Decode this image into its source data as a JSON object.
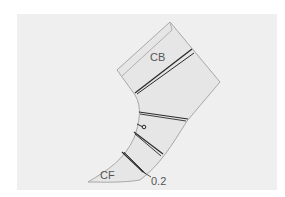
{
  "diagram": {
    "type": "sewing-pattern-piece",
    "labels": {
      "center_back": "CB",
      "center_front": "CF",
      "measurement": "0.2"
    },
    "colors": {
      "background": "#ffffff",
      "panel": "#efefef",
      "piece_fill": "#e6e6e6",
      "outline": "#a8a8a8",
      "slash_lines": "#2a2a2a"
    }
  }
}
